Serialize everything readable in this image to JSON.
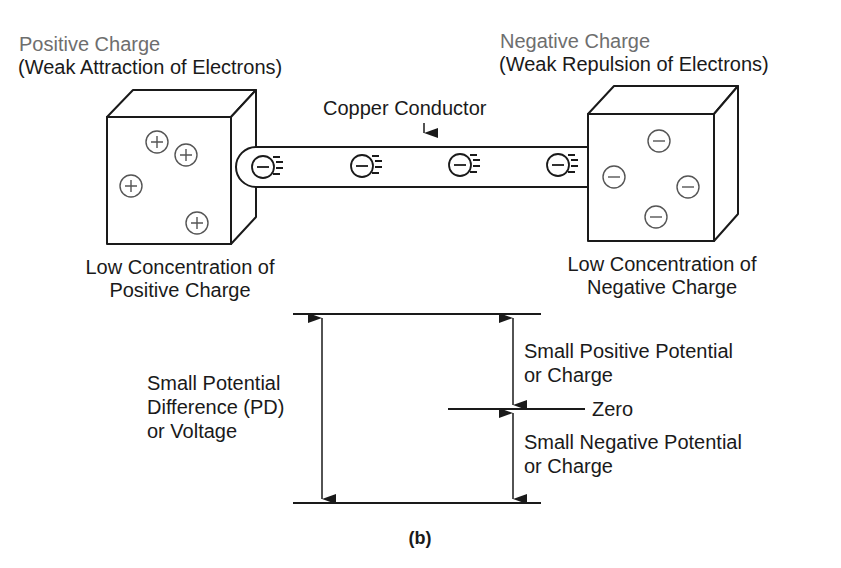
{
  "left_box": {
    "title": "Positive Charge",
    "subtitle": "(Weak Attraction of Electrons)",
    "caption_line1": "Low Concentration of",
    "caption_line2": "Positive Charge",
    "charge_symbol": "+",
    "charge_count": 4
  },
  "right_box": {
    "title": "Negative Charge",
    "subtitle": "(Weak Repulsion of Electrons)",
    "caption_line1": "Low Concentration of",
    "caption_line2": "Negative Charge",
    "charge_symbol": "−",
    "charge_count": 4
  },
  "conductor": {
    "label": "Copper Conductor",
    "electron_count": 4,
    "electron_symbol": "−"
  },
  "potential_scale": {
    "pd_line1": "Small Potential",
    "pd_line2": "Difference (PD)",
    "pd_line3": "or Voltage",
    "positive_line1": "Small Positive Potential",
    "positive_line2": "or Charge",
    "zero_label": "Zero",
    "negative_line1": "Small Negative Potential",
    "negative_line2": "or Charge"
  },
  "figure_label": "(b)",
  "colors": {
    "line": "#1a1a1a",
    "heading_gray": "#6e6e6e",
    "charge_circle": "#555555",
    "background": "#ffffff"
  }
}
